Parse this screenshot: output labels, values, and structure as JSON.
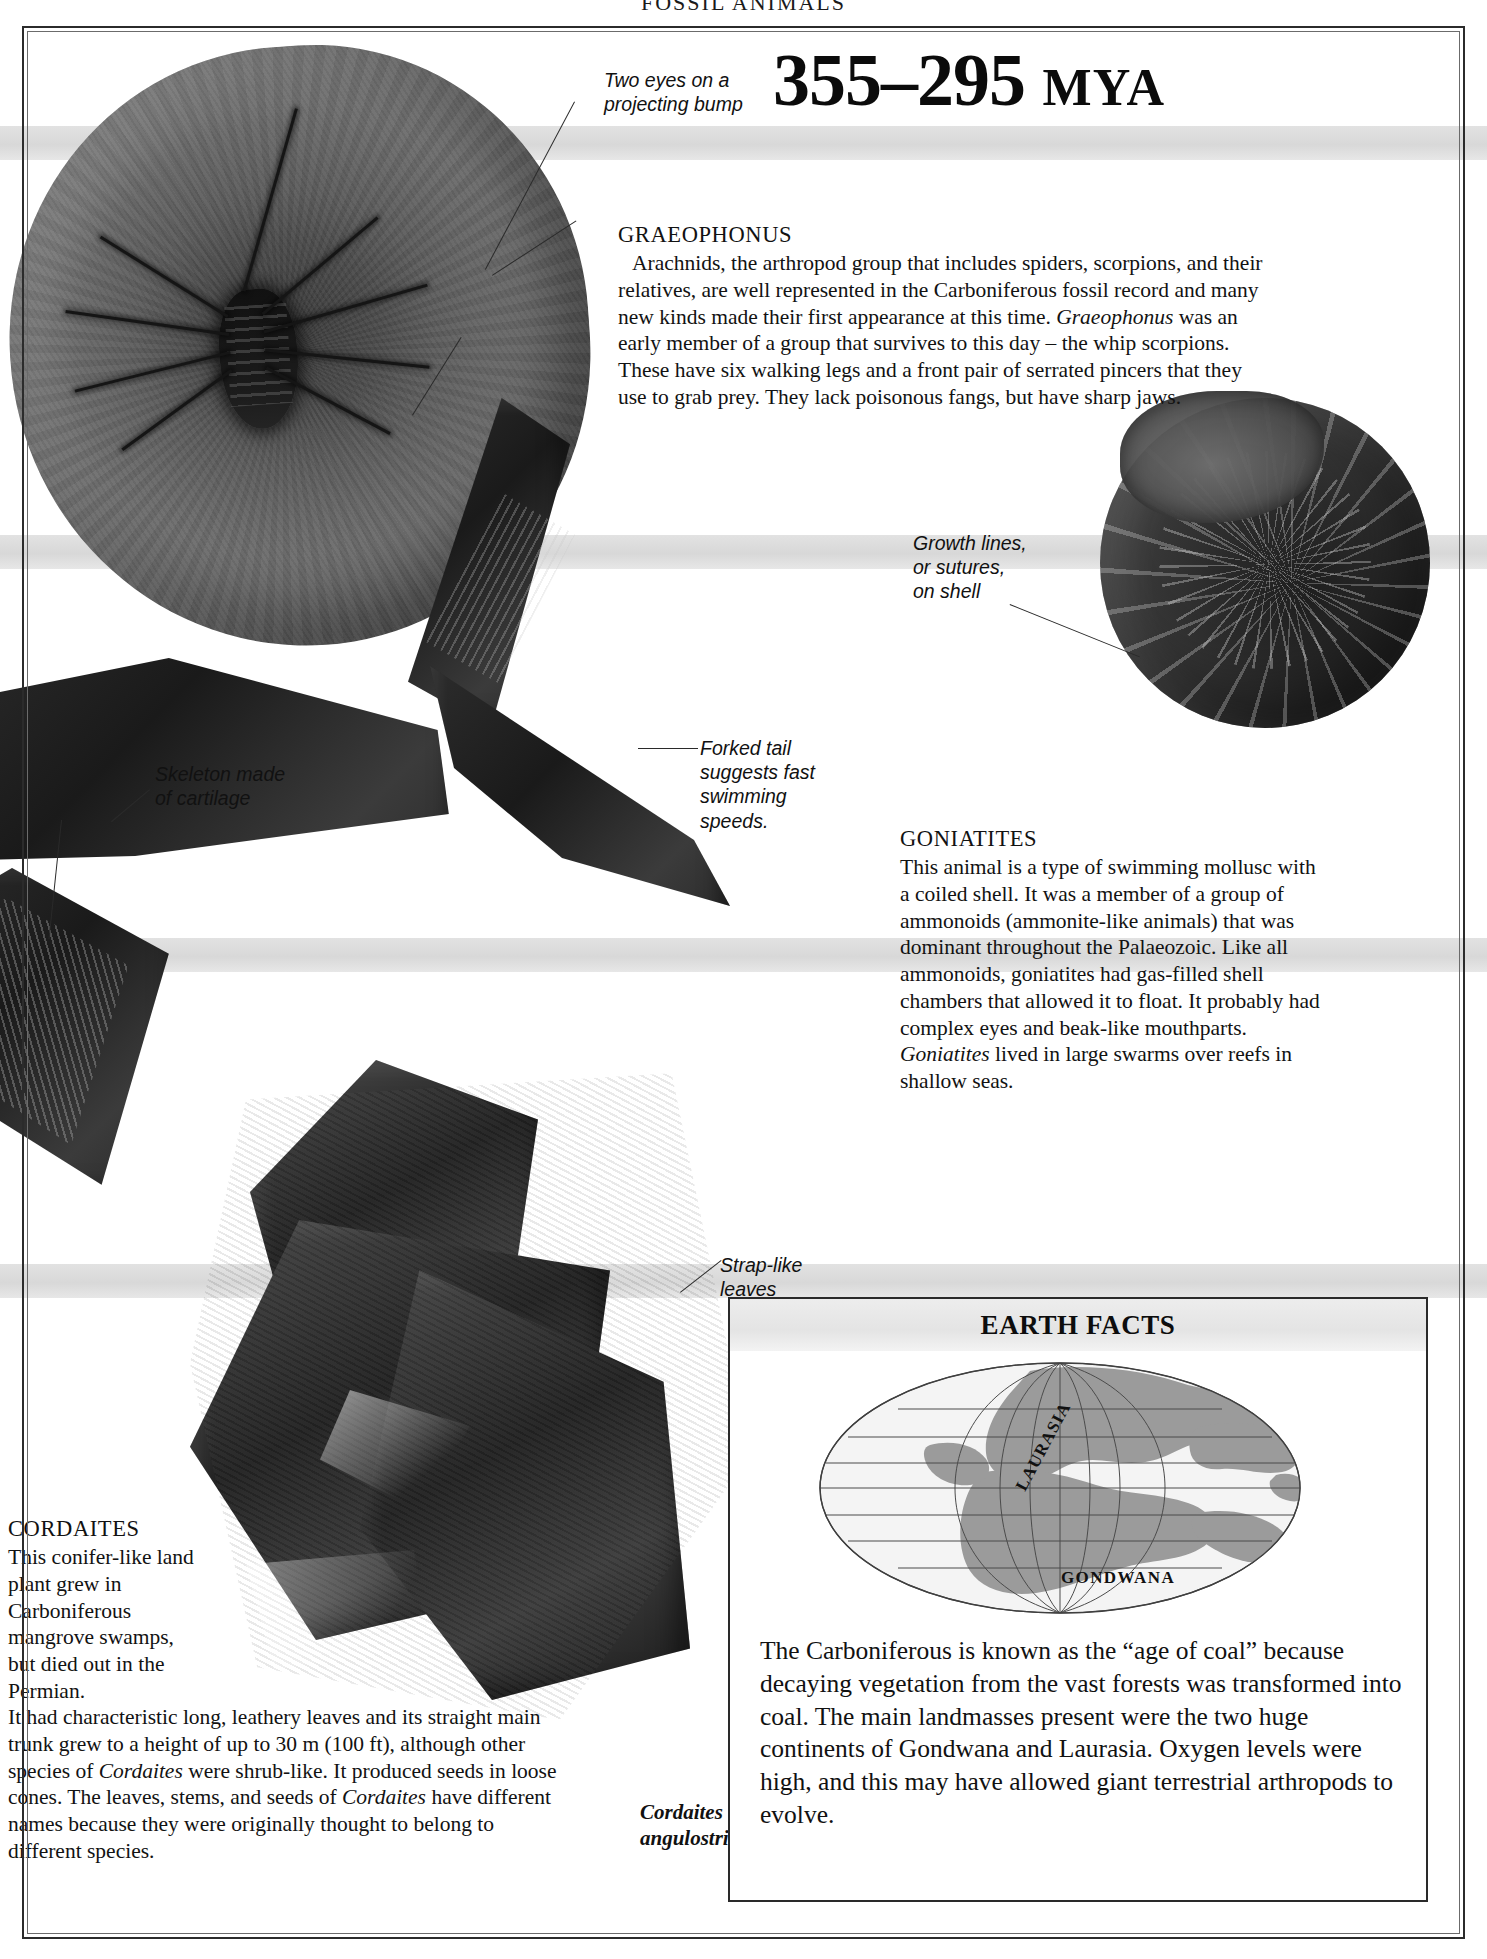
{
  "page": {
    "running_head": "FOSSIL ANIMALS",
    "era_range": "355–295",
    "era_unit": "MYA"
  },
  "annotations": [
    {
      "id": "two-eyes",
      "text": "Two eyes on a\nprojecting bump"
    },
    {
      "id": "growth-lines",
      "text": "Growth lines,\nor sutures,\non shell"
    },
    {
      "id": "skeleton-cartilage",
      "text": "Skeleton made\nof cartilage"
    },
    {
      "id": "forked-tail",
      "text": "Forked tail\nsuggests fast\nswimming\nspeeds."
    },
    {
      "id": "strap-like-leaves",
      "text": "Strap-like\nleaves"
    }
  ],
  "blocks": {
    "graeophonus": {
      "heading": "GRAEOPHONUS",
      "body_html": "Arachnids, the arthropod group that includes spiders, scorpions, and their relatives, are well represented in the Carboniferous fossil record and many new kinds made their first appearance at this time. <em>Graeophonus</em> was an early member of a group that survives to this day – the whip scorpions. These have six walking legs and a front pair of serrated pincers that they use to grab prey. They lack poisonous fangs, but have sharp jaws."
    },
    "goniatites": {
      "heading": "GONIATITES",
      "body_html": "This animal is a type of swimming mollusc with a coiled shell. It was a member of a group of ammonoids (ammonite-like animals) that was dominant throughout the Palaeozoic. Like all ammonoids, goniatites had gas-filled shell chambers that allowed it to float. It probably had complex eyes and beak-like mouthparts. <em>Goniatites</em> lived in large swarms over reefs in shallow seas."
    },
    "cordaites": {
      "heading": "CORDAITES",
      "body_narrow_html": "This conifer-like land plant grew in Carboniferous mangrove swamps, but died out in the Permian.",
      "body_wide_html": "It had characteristic long, leathery leaves and its straight main trunk grew to a height of up to 30 m (100 ft), although other species of <em>Cordaites</em> were shrub-like. It produced seeds in loose cones. The leaves, stems, and seeds of <em>Cordaites</em> have different names because they were originally thought to belong to different species."
    }
  },
  "plant_caption": {
    "line1": "Cordaites",
    "line2": "angulostriatus"
  },
  "earth_facts": {
    "title": "EARTH FACTS",
    "map": {
      "labels": [
        {
          "name": "LAURASIA"
        },
        {
          "name": "GONDWANA"
        }
      ],
      "land_color": "#9a9a9a",
      "ocean_color": "#f4f4f4",
      "graticule_color": "#4b4b4b"
    },
    "text": "The Carboniferous is known as the “age of coal” because decaying vegetation from the vast forests was transformed into coal. The main landmasses present were the two huge continents of Gondwana and Laurasia. Oxygen levels were high, and this may have allowed giant terrestrial arthropods to evolve."
  },
  "colors": {
    "frame": "#2b2b2b",
    "band": "#dcdcdc",
    "text": "#111111"
  }
}
